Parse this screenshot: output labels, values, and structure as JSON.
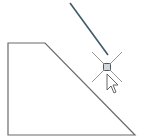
{
  "canvas": {
    "background": "#ffffff",
    "shape": {
      "type": "polygon",
      "points": "8,43 45,43 135,135 8,135",
      "stroke": "#6b6b6b"
    },
    "active_line": {
      "x1": 70,
      "y1": 3,
      "x2": 108,
      "y2": 55,
      "stroke": "#3f5a6a"
    },
    "snap_marker": {
      "x": 107,
      "y": 67,
      "crosshair_color": "#8a8a8a"
    },
    "cursor": {
      "icon": "arrow-cursor-icon"
    }
  }
}
